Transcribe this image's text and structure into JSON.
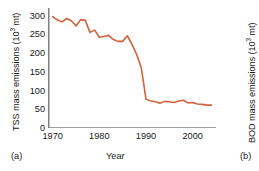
{
  "figure": {
    "panel_a_tag": "(a)",
    "panel_b_tag": "(b)",
    "x_axis_title": "Year",
    "y_axis_title_left_pre": "TSS mass emissions (10",
    "y_axis_title_left_sup": "3",
    "y_axis_title_left_post": " mt)",
    "y_axis_title_right_pre": "BOD mass emissions (10",
    "y_axis_title_right_sup": "3",
    "y_axis_title_right_post": " mt)"
  },
  "chart_data": {
    "type": "line",
    "title": "",
    "xlabel": "Year",
    "ylabel": "TSS mass emissions (10^3 mt)",
    "xlim": [
      1969,
      2005
    ],
    "ylim": [
      0,
      320
    ],
    "xticks": [
      1970,
      1975,
      1980,
      1985,
      1990,
      1995,
      2000,
      2005
    ],
    "xtick_labels": [
      "1970",
      "",
      "1980",
      "",
      "1990",
      "",
      "2000",
      ""
    ],
    "yticks": [
      0,
      50,
      100,
      150,
      200,
      250,
      300
    ],
    "ytick_labels": [
      "0",
      "50",
      "100",
      "150",
      "200",
      "250",
      "300"
    ],
    "grid": false,
    "legend": false,
    "line_color": "#d4603c",
    "axis_color": "#808080",
    "series": [
      {
        "name": "TSS mass emissions",
        "x": [
          1970,
          1971,
          1972,
          1973,
          1974,
          1975,
          1976,
          1977,
          1978,
          1979,
          1980,
          1981,
          1982,
          1983,
          1984,
          1985,
          1986,
          1987,
          1988,
          1989,
          1990,
          1991,
          1992,
          1993,
          1994,
          1995,
          1996,
          1997,
          1998,
          1999,
          2000,
          2001,
          2002,
          2003,
          2004
        ],
        "values": [
          297,
          288,
          283,
          292,
          286,
          272,
          289,
          287,
          255,
          261,
          242,
          244,
          247,
          236,
          231,
          231,
          246,
          223,
          196,
          160,
          77,
          72,
          70,
          66,
          71,
          70,
          68,
          72,
          74,
          67,
          68,
          64,
          63,
          61,
          61
        ]
      }
    ]
  }
}
